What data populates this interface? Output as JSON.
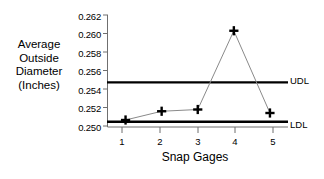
{
  "chart_data": {
    "type": "line",
    "title": "",
    "xlabel": "Snap Gages",
    "ylabel": "Average Outside Diameter (Inches)",
    "ylabel_lines": [
      "Average",
      "Outside",
      "Diameter",
      "(Inches)"
    ],
    "categories": [
      "1",
      "2",
      "3",
      "4",
      "5"
    ],
    "x": [
      1,
      2,
      3,
      4,
      5
    ],
    "values": [
      0.2504,
      0.2514,
      0.2516,
      0.2606,
      0.2512
    ],
    "series": [
      {
        "name": "Average Outside Diameter",
        "values": [
          0.2504,
          0.2514,
          0.2516,
          0.2606,
          0.2512
        ],
        "marker": "plus",
        "marker_color": "#000000",
        "line_color": "#888888"
      }
    ],
    "ylim": [
      0.2496,
      0.2624
    ],
    "xlim": [
      0.5,
      5.5
    ],
    "yticks": [
      0.25,
      0.252,
      0.254,
      0.256,
      0.258,
      0.26,
      0.262
    ],
    "ytick_labels": [
      "0.250",
      "0.252",
      "0.254",
      "0.256",
      "0.258",
      "0.260",
      "0.262"
    ],
    "xticks": [
      1,
      2,
      3,
      4,
      5
    ],
    "xtick_labels": [
      "1",
      "2",
      "3",
      "4",
      "5"
    ],
    "grid": false,
    "legend": "none",
    "reference_lines": [
      {
        "name": "UDL",
        "label": "UDL",
        "value": 0.2547,
        "color": "#000000"
      },
      {
        "name": "LDL",
        "label": "LDL",
        "value": 0.2502,
        "color": "#000000"
      }
    ]
  },
  "axis": {
    "y_title_lines": [
      "Average",
      "Outside",
      "Diameter",
      "(Inches)"
    ],
    "x_title": "Snap Gages"
  },
  "limits": {
    "upper_label": "UDL",
    "lower_label": "LDL"
  },
  "colors": {
    "axis": "#6f6f6f",
    "line": "#8a8a8a",
    "marker": "#000000",
    "limit": "#000000",
    "background": "#ffffff"
  }
}
